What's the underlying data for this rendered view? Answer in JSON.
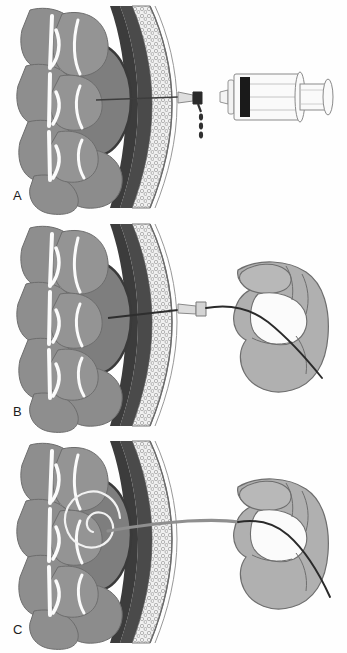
{
  "figure": {
    "type": "medical-illustration",
    "background_color": "#fefefe",
    "panel_count": 3
  },
  "palette": {
    "background": "#fefefe",
    "tissue_gray": "#8e8e8e",
    "tissue_gray_light": "#9a9a9a",
    "cavity_gray": "#7f7f7f",
    "cavity_wall_dark": "#3a3a3a",
    "muscle_dark": "#4a4a4a",
    "fat_stipple": "#efefef",
    "septa_white": "#fbfbfb",
    "skin_line": "#6b6b6b",
    "hand_gray": "#b0b0b0",
    "hand_outline": "#6e6e6e",
    "needle_metal": "#9d9d9d",
    "needle_line": "#3d3d3d",
    "syringe_outline": "#8a8a8a",
    "plunger_black": "#1a1a1a",
    "droplet": "#303030",
    "catheter_dark": "#262626",
    "catheter_coil": "#f2f2f2",
    "label_color": "#1c1c1c"
  },
  "panels": [
    {
      "id": "a",
      "label": "A",
      "caption": "Needle inserted through tissue layers into cavity; syringe with droplets",
      "elements": [
        "abdominal-wall-cross-section",
        "fluid-cavity",
        "insertion-needle",
        "needle-hub",
        "fluid-droplets",
        "syringe"
      ],
      "droplet_count": 3
    },
    {
      "id": "b",
      "label": "B",
      "caption": "Guidewire advanced through needle by operator's hand",
      "elements": [
        "abdominal-wall-cross-section",
        "fluid-cavity",
        "insertion-needle",
        "needle-hub",
        "guidewire",
        "operator-hand"
      ]
    },
    {
      "id": "c",
      "label": "C",
      "caption": "Catheter coiled within cavity after placement",
      "elements": [
        "abdominal-wall-cross-section",
        "fluid-cavity",
        "coiled-catheter",
        "catheter-shaft",
        "operator-hand"
      ],
      "coil_turns": 2
    }
  ],
  "anatomy_layers": [
    {
      "name": "visceral-organs",
      "description": "lobulated gray masses at left"
    },
    {
      "name": "fluid-cavity",
      "description": "large oval collection"
    },
    {
      "name": "cavity-wall",
      "description": "dark rim surrounding cavity"
    },
    {
      "name": "muscle-layer",
      "description": "dark band"
    },
    {
      "name": "subcutaneous-fat",
      "description": "stippled cellular layer"
    },
    {
      "name": "skin",
      "description": "outer thin lines"
    }
  ],
  "instruments": {
    "syringe": {
      "name": "syringe",
      "barrel": "transparent",
      "plunger_stopper": "black",
      "visible_in_panel": "A"
    },
    "needle": {
      "name": "insertion-needle",
      "visible_in_panels": "A,B"
    },
    "guidewire": {
      "name": "guidewire",
      "visible_in_panels": "B,C"
    },
    "catheter": {
      "name": "pigtail-catheter",
      "visible_in_panel": "C"
    }
  }
}
